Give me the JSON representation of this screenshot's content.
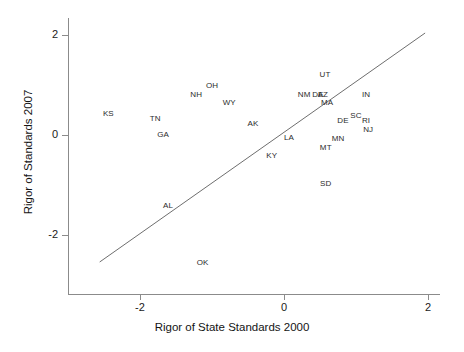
{
  "chart_data": {
    "type": "scatter",
    "title": "",
    "xlabel": "Rigor of State Standards 2000",
    "ylabel": "Rigor of Standards 2007",
    "xlim": [
      -2.95,
      2.18
    ],
    "ylim": [
      -2.55,
      2.35
    ],
    "xticks": [
      -2,
      0,
      2
    ],
    "xtick_labels": [
      "-2",
      "0",
      "2"
    ],
    "yticks": [
      2,
      0,
      -2
    ],
    "ytick_labels": [
      "2",
      "0",
      "-2"
    ],
    "grid": false,
    "legend": null,
    "point_marker": "text-label",
    "trend_line": {
      "label": "reference line",
      "x_start": -2.56,
      "y_start": -2.54,
      "x_end": 1.96,
      "y_end": 2.04,
      "color": "#6e6e6e"
    },
    "points": [
      {
        "label": "KS",
        "x": -2.44,
        "y": 0.44
      },
      {
        "label": "TN",
        "x": -1.79,
        "y": 0.34
      },
      {
        "label": "GA",
        "x": -1.68,
        "y": 0.02
      },
      {
        "label": "NH",
        "x": -1.22,
        "y": 0.82
      },
      {
        "label": "OH",
        "x": -1.0,
        "y": 1.0
      },
      {
        "label": "WY",
        "x": -0.76,
        "y": 0.66
      },
      {
        "label": "AK",
        "x": -0.43,
        "y": 0.24
      },
      {
        "label": "AL",
        "x": -1.61,
        "y": -1.4
      },
      {
        "label": "OK",
        "x": -1.13,
        "y": -2.54
      },
      {
        "label": "KY",
        "x": -0.17,
        "y": -0.4
      },
      {
        "label": "LA",
        "x": 0.07,
        "y": -0.04
      },
      {
        "label": "NM",
        "x": 0.28,
        "y": 0.82
      },
      {
        "label": "DE",
        "x": 0.47,
        "y": 0.82
      },
      {
        "label": "AZ",
        "x": 0.54,
        "y": 0.82
      },
      {
        "label": "UT",
        "x": 0.57,
        "y": 1.22
      },
      {
        "label": "MA",
        "x": 0.6,
        "y": 0.66
      },
      {
        "label": "IN",
        "x": 1.14,
        "y": 0.82
      },
      {
        "label": "SC",
        "x": 1.0,
        "y": 0.4
      },
      {
        "label": "DE",
        "x": 0.82,
        "y": 0.3
      },
      {
        "label": "RI",
        "x": 1.14,
        "y": 0.3
      },
      {
        "label": "NJ",
        "x": 1.17,
        "y": 0.12
      },
      {
        "label": "MN",
        "x": 0.75,
        "y": -0.06
      },
      {
        "label": "MT",
        "x": 0.58,
        "y": -0.24
      },
      {
        "label": "SD",
        "x": 0.58,
        "y": -0.96
      }
    ]
  }
}
